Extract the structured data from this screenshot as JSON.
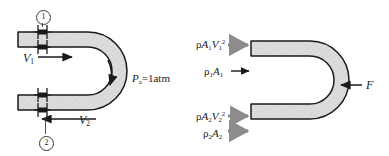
{
  "figure": {
    "colors": {
      "fluid_fill": "#d9d9d9",
      "outline": "#1a1a1a",
      "gray_arrow": "#8c8c8c",
      "black_arrow": "#1a1a1a",
      "background": "#ffffff"
    }
  },
  "left_diagram": {
    "name": "pipe-bend-physical",
    "station_1_label": "1",
    "station_2_label": "2",
    "inlet_velocity": {
      "symbol": "V",
      "subscript": "1"
    },
    "outlet_velocity": {
      "symbol": "V",
      "subscript": "2"
    },
    "ambient_pressure": {
      "symbol": "P",
      "subscript": "a",
      "value": "=1atm"
    },
    "flange_count": 4,
    "flow_direction_inlet": "right",
    "flow_direction_outlet": "left",
    "bend_flow_arrow": "curved-down"
  },
  "right_diagram": {
    "name": "pipe-bend-free-body",
    "forces": [
      {
        "id": "momentum-flux-inlet",
        "rho": "ρ",
        "area": "A",
        "area_sub": "1",
        "vel": "V",
        "vel_sub": "1",
        "vel_sup": "2",
        "arrow_style": "gray",
        "direction": "right"
      },
      {
        "id": "pressure-force-inlet",
        "rho": "ρ",
        "rho_sub": "1",
        "area": "A",
        "area_sub": "1",
        "arrow_style": "black",
        "direction": "right"
      },
      {
        "id": "momentum-flux-outlet",
        "rho": "ρ",
        "area": "A",
        "area_sub": "2",
        "vel": "V",
        "vel_sub": "2",
        "vel_sup": "2",
        "arrow_style": "gray",
        "direction": "right"
      },
      {
        "id": "pressure-force-outlet",
        "rho": "ρ",
        "rho_sub": "2",
        "area": "A",
        "area_sub": "2",
        "arrow_style": "gray",
        "direction": "right"
      },
      {
        "id": "reaction-force",
        "symbol": "F",
        "arrow_style": "black",
        "direction": "left"
      }
    ]
  }
}
